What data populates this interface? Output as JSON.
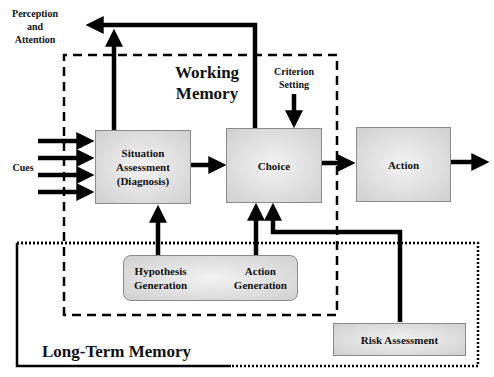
{
  "diagram": {
    "regions": {
      "working_memory": "Working Memory",
      "long_term_memory": "Long-Term Memory"
    },
    "nodes": {
      "perception": "Perception and Attention",
      "perception_lines": [
        "Perception",
        "and",
        "Attention"
      ],
      "cues": "Cues",
      "situation_assessment": [
        "Situation",
        "Assessment",
        "(Diagnosis)"
      ],
      "choice": "Choice",
      "action": "Action",
      "criterion_setting": [
        "Criterion",
        "Setting"
      ],
      "hypothesis_generation": [
        "Hypothesis",
        "Generation"
      ],
      "action_generation": [
        "Action",
        "Generation"
      ],
      "risk_assessment": "Risk Assessment"
    },
    "working_memory_lines": [
      "Working",
      "Memory"
    ],
    "edges": [
      {
        "from": "Cues",
        "to": "Situation Assessment",
        "count": 4
      },
      {
        "from": "Situation Assessment",
        "to": "Choice"
      },
      {
        "from": "Choice",
        "to": "Action"
      },
      {
        "from": "Action",
        "to": "output"
      },
      {
        "from": "Situation Assessment",
        "to": "Perception and Attention"
      },
      {
        "from": "Choice",
        "to": "Perception and Attention"
      },
      {
        "from": "Criterion Setting",
        "to": "Choice"
      },
      {
        "from": "Hypothesis Generation",
        "to": "Situation Assessment"
      },
      {
        "from": "Action Generation",
        "to": "Choice"
      },
      {
        "from": "Risk Assessment",
        "to": "Choice"
      }
    ]
  }
}
